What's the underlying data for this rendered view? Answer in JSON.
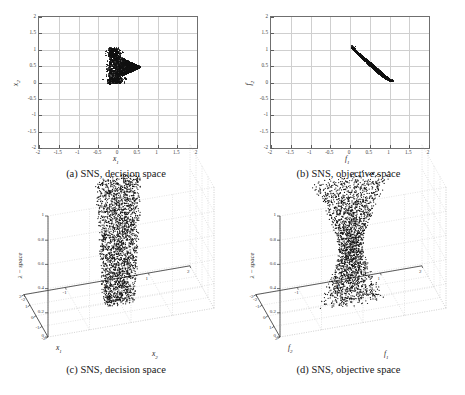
{
  "figure": {
    "panels": [
      {
        "id": "a",
        "caption": "(a) SNS, decision space",
        "xlabel": "x",
        "xsub": "1",
        "ylabel": "x",
        "ysub": "2",
        "xticks": [
          "-2",
          "-1.5",
          "-1",
          "-0.5",
          "0",
          "0.5",
          "1",
          "1.5",
          "2"
        ],
        "yticks": [
          "2",
          "1.5",
          "1",
          "0.5",
          "0",
          "-0.5",
          "-1",
          "-1.5",
          "-2"
        ]
      },
      {
        "id": "b",
        "caption": "(b) SNS, objective space",
        "xlabel": "f",
        "xsub": "1",
        "ylabel": "f",
        "ysub": "2",
        "xticks": [
          "-2",
          "-1.5",
          "-1",
          "-0.5",
          "0",
          "0.5",
          "1",
          "1.5",
          "2"
        ],
        "yticks": [
          "2",
          "1.5",
          "1",
          "0.5",
          "0",
          "-0.5",
          "-1",
          "-1.5",
          "-2"
        ]
      },
      {
        "id": "c",
        "caption": "(c) SNS, decision space",
        "leftlabel": "x",
        "leftsub": "1",
        "rightlabel": "x",
        "rightsub": "2",
        "zlabel": "λ − space",
        "leftticks": [
          "-2",
          "-1",
          "0",
          "1",
          "2"
        ],
        "rightticks": [
          "-2",
          "-1",
          "0",
          "1",
          "2"
        ],
        "zticks": [
          "1",
          "0.8",
          "0.6",
          "0.4",
          "0.2",
          "0"
        ]
      },
      {
        "id": "d",
        "caption": "(d) SNS, objective space",
        "leftlabel": "f",
        "leftsub": "2",
        "rightlabel": "f",
        "rightsub": "1",
        "zlabel": "λ − space",
        "leftticks": [
          "2",
          "1",
          "0",
          "-1",
          "-2"
        ],
        "rightticks": [
          "-2",
          "-1",
          "0",
          "1",
          "2"
        ],
        "zticks": [
          "1",
          "0.8",
          "0.6",
          "0.4",
          "0.2",
          "0"
        ]
      }
    ]
  },
  "chart_data": [
    {
      "type": "scatter",
      "panel": "a",
      "title": "(a) SNS, decision space",
      "xlabel": "x1",
      "ylabel": "x2",
      "xlim": [
        -2,
        2
      ],
      "ylim": [
        -2,
        2
      ],
      "grid": true,
      "xticks": [
        -2,
        -1.5,
        -1,
        -0.5,
        0,
        0.5,
        1,
        1.5,
        2
      ],
      "yticks": [
        -2,
        -1.5,
        -1,
        -0.5,
        0,
        0.5,
        1,
        1.5,
        2
      ],
      "marker": "dot-black",
      "description": "Dense arrowhead/triangular cluster of solutions centred near (0.1, 0.45), spanning x1 from about -0.30 to 0.55 and x2 from about -0.02 to 1.02, with a sharp rightward point near (0.55, 0.48) and a few sparse outlying dots to the left near x1 = -0.30.",
      "cluster_center": [
        0.1,
        0.45
      ],
      "cluster_xrange": [
        -0.3,
        0.55
      ],
      "cluster_yrange": [
        -0.02,
        1.02
      ],
      "n_points": 1600
    },
    {
      "type": "scatter",
      "panel": "b",
      "title": "(b) SNS, objective space",
      "xlabel": "f1",
      "ylabel": "f2",
      "xlim": [
        -2,
        2
      ],
      "ylim": [
        -2,
        2
      ],
      "grid": true,
      "xticks": [
        -2,
        -1.5,
        -1,
        -0.5,
        0,
        0.5,
        1,
        1.5,
        2
      ],
      "yticks": [
        -2,
        -1.5,
        -1,
        -0.5,
        0,
        0.5,
        1,
        1.5,
        2
      ],
      "marker": "dot-black",
      "description": "Dense lens/leaf shaped cloud running from the upper-left tip at about (0.05, 1.05) down to the lower-right tip at about (1.05, 0.05); the band bulges below the anti-diagonal, widest near f1 = 0.55 where f2 spans roughly 0.35 to 0.72.",
      "tip_upper_left": [
        0.05,
        1.05
      ],
      "tip_lower_right": [
        1.05,
        0.05
      ],
      "n_points": 1600
    },
    {
      "type": "scatter3d",
      "panel": "c",
      "title": "(c) SNS, decision space",
      "xlabel": "x1",
      "ylabel": "x2",
      "zlabel": "λ − space",
      "xlim": [
        -2,
        2
      ],
      "ylim": [
        -2,
        2
      ],
      "zlim": [
        0,
        1
      ],
      "grid": true,
      "xticks": [
        -2,
        -1,
        0,
        1,
        2
      ],
      "yticks": [
        -2,
        -1,
        0,
        1,
        2
      ],
      "zticks": [
        0,
        0.2,
        0.4,
        0.6,
        0.8,
        1
      ],
      "marker": "dot-black",
      "description": "A near-vertical column of about 40 stacked horizontal scatter layers, one layer per lambda level from 0 to 1. Each layer is a small cluster around x1 = 0, x2 = 0 with width approximately 0.6 in x1 and 0.8 in x2; the column leans slightly and is marginally wider near the top (lambda close to 0.9) than near the bottom.",
      "n_layers": 40,
      "layer_center": [
        0.0,
        0.0
      ],
      "layer_spread": [
        0.6,
        0.8
      ]
    },
    {
      "type": "scatter3d",
      "panel": "d",
      "title": "(d) SNS, objective space",
      "xlabel": "f1",
      "ylabel": "f2",
      "zlabel": "λ − space",
      "xlim": [
        -2,
        2
      ],
      "ylim": [
        -2,
        2
      ],
      "zlim": [
        0,
        1
      ],
      "grid": true,
      "xticks": [
        -2,
        -1,
        0,
        1,
        2
      ],
      "yticks": [
        -2,
        -1,
        0,
        1,
        2
      ],
      "zticks": [
        0,
        0.2,
        0.4,
        0.6,
        0.8,
        1
      ],
      "marker": "dot-black",
      "description": "About 40 stacked horizontal scatter layers forming an hourglass / bow-tie silhouette: layers are widest at the top (lambda close to 1) and at the bottom (lambda close to 0) and pinch to their narrowest around lambda = 0.45, each layer centred near f1 = 0, f2 = 0.",
      "n_layers": 40,
      "waist_lambda": 0.45,
      "layer_center": [
        0.0,
        0.0
      ]
    }
  ]
}
